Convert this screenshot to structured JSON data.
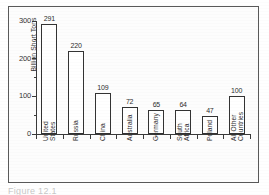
{
  "figure": {
    "caption": "Figure 12.1"
  },
  "chart_data": {
    "type": "bar",
    "title": "",
    "xlabel": "",
    "ylabel": "Billion Short Tons",
    "ylim": [
      0,
      300
    ],
    "grid": false,
    "legend": "none",
    "ytick_labels": [
      "0",
      "100",
      "200",
      "300"
    ],
    "ytick_values": [
      0,
      100,
      200,
      300
    ],
    "yminor_values": [
      50,
      150,
      250
    ],
    "categories": [
      "United States",
      "Russia",
      "China",
      "Australia",
      "Germany",
      "South Africa",
      "Poland",
      "All Other Countries"
    ],
    "category_lines": [
      [
        "United",
        "States"
      ],
      [
        "Russia"
      ],
      [
        "China"
      ],
      [
        "Australia"
      ],
      [
        "Germany"
      ],
      [
        "South",
        "Africa"
      ],
      [
        "Poland"
      ],
      [
        "All Other",
        "Countries"
      ]
    ],
    "values": [
      291,
      220,
      109,
      72,
      65,
      64,
      47,
      100
    ],
    "value_labels": [
      "291",
      "220",
      "109",
      "72",
      "65",
      "64",
      "47",
      "100"
    ],
    "bar_facecolor": "#ffffff",
    "bar_edgecolor": "#333333",
    "axis_color": "#3a3a3a"
  }
}
